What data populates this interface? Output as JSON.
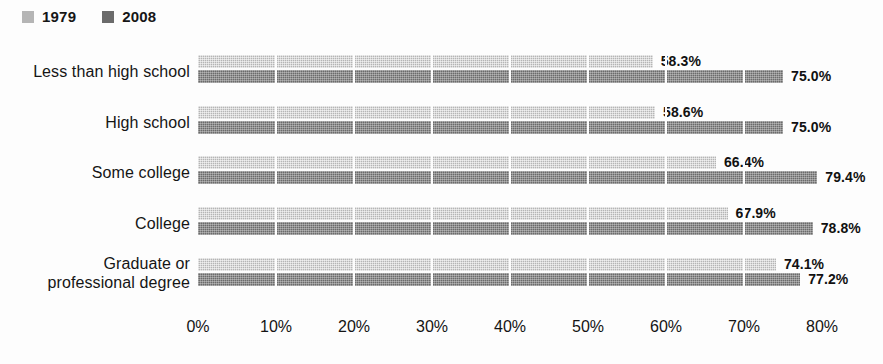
{
  "legend": {
    "position": "top-left",
    "entries": [
      {
        "label": "1979",
        "color": "#b5b5b5",
        "swatch_icon": "legend-swatch-icon"
      },
      {
        "label": "2008",
        "color": "#6b6b6b",
        "swatch_icon": "legend-swatch-icon"
      }
    ]
  },
  "axis": {
    "ticks": [
      "0%",
      "10%",
      "20%",
      "30%",
      "40%",
      "50%",
      "60%",
      "70%",
      "80%"
    ]
  },
  "chart_data": {
    "type": "bar",
    "orientation": "horizontal",
    "title": "",
    "subtitle": "",
    "xlabel": "",
    "ylabel": "",
    "xlim": [
      0,
      80
    ],
    "xtick_step": 10,
    "grid": true,
    "legend_position": "top-left",
    "categories": [
      "Less than high school",
      "High school",
      "Some college",
      "College",
      "Graduate or professional degree"
    ],
    "series": [
      {
        "name": "1979",
        "color": "#b5b5b5",
        "values": [
          58.3,
          58.6,
          66.4,
          67.9,
          74.1
        ]
      },
      {
        "name": "2008",
        "color": "#6b6b6b",
        "values": [
          75.0,
          75.0,
          79.4,
          78.8,
          77.2
        ]
      }
    ],
    "data_labels": [
      {
        "category": "Less than high school",
        "1979": "58.3%",
        "2008": "75.0%"
      },
      {
        "category": "High school",
        "1979": "58.6%",
        "2008": "75.0%"
      },
      {
        "category": "Some college",
        "1979": "66.4%",
        "2008": "79.4%"
      },
      {
        "category": "College",
        "1979": "67.9%",
        "2008": "78.8%"
      },
      {
        "category": "Graduate or professional degree",
        "1979": "74.1%",
        "2008": "77.2%"
      }
    ]
  },
  "rows": [
    {
      "label_line1": "Less than high school",
      "label_line2": "",
      "v1979": 58.3,
      "v2008": 75.0,
      "l1979": "58.3%",
      "l2008": "75.0%"
    },
    {
      "label_line1": "High school",
      "label_line2": "",
      "v1979": 58.6,
      "v2008": 75.0,
      "l1979": "58.6%",
      "l2008": "75.0%"
    },
    {
      "label_line1": "Some college",
      "label_line2": "",
      "v1979": 66.4,
      "v2008": 79.4,
      "l1979": "66.4%",
      "l2008": "79.4%"
    },
    {
      "label_line1": "College",
      "label_line2": "",
      "v1979": 67.9,
      "v2008": 78.8,
      "l1979": "67.9%",
      "l2008": "78.8%"
    },
    {
      "label_line1": "Graduate or",
      "label_line2": "professional degree",
      "v1979": 74.1,
      "v2008": 77.2,
      "l1979": "74.1%",
      "l2008": "77.2%"
    }
  ]
}
